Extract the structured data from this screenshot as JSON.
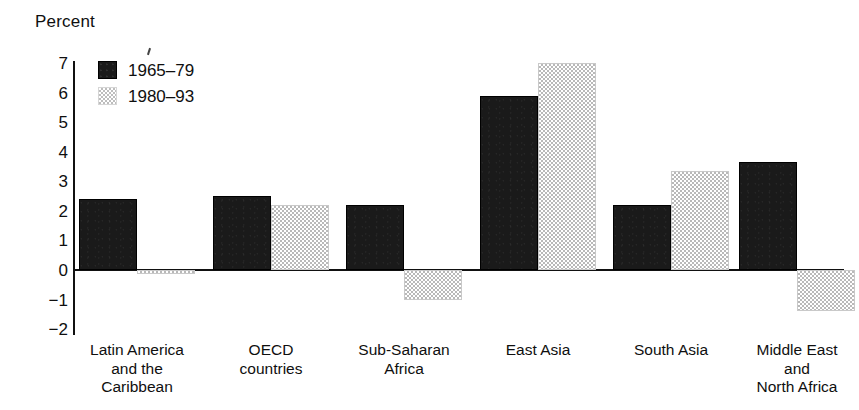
{
  "axis_title": "Percent",
  "legend": [
    {
      "label": "1965–79",
      "swatch": "dark-swatch"
    },
    {
      "label": "1980–93",
      "swatch": "light-swatch"
    }
  ],
  "y_ticks": [
    {
      "label": "7",
      "value": 7
    },
    {
      "label": "6",
      "value": 6
    },
    {
      "label": "5",
      "value": 5
    },
    {
      "label": "4",
      "value": 4
    },
    {
      "label": "3",
      "value": 3
    },
    {
      "label": "2",
      "value": 2
    },
    {
      "label": "1",
      "value": 1
    },
    {
      "label": "0",
      "value": 0
    },
    {
      "label": "−1",
      "value": -1
    },
    {
      "label": "−2",
      "value": -2
    }
  ],
  "categories": [
    {
      "lines": [
        "Latin America",
        "and the",
        "Caribbean"
      ]
    },
    {
      "lines": [
        "OECD",
        "countries"
      ]
    },
    {
      "lines": [
        "Sub-Saharan",
        "Africa"
      ]
    },
    {
      "lines": [
        "East Asia"
      ]
    },
    {
      "lines": [
        "South Asia"
      ]
    },
    {
      "lines": [
        "Middle East",
        "and",
        "North Africa"
      ]
    }
  ],
  "colors": {
    "series_1965_79": "#1a1a1a",
    "series_1980_93": "#c4c4c4",
    "axis": "#111111",
    "background": "#ffffff"
  },
  "chart_data": {
    "type": "bar",
    "title": "",
    "subtitle": "",
    "xlabel": "",
    "ylabel": "Percent",
    "ylim": [
      -2,
      7
    ],
    "grid": false,
    "legend_position": "top-left-inside",
    "categories": [
      "Latin America and the Caribbean",
      "OECD countries",
      "Sub-Saharan Africa",
      "East Asia",
      "South Asia",
      "Middle East and North Africa"
    ],
    "series": [
      {
        "name": "1965–79",
        "values": [
          2.4,
          2.5,
          2.2,
          5.9,
          2.2,
          3.65
        ]
      },
      {
        "name": "1980–93",
        "values": [
          -0.15,
          2.2,
          -1.0,
          7.0,
          3.35,
          -1.4
        ]
      }
    ]
  },
  "layout": {
    "plot_left": 73,
    "plot_right": 844,
    "y_top_px": 63,
    "y_zero_px": 270,
    "y_bottom_px": 333,
    "value_top": 7,
    "value_bottom": -2,
    "bar_width": 58,
    "group_centers": [
      137,
      271,
      404,
      538,
      671,
      797
    ]
  }
}
